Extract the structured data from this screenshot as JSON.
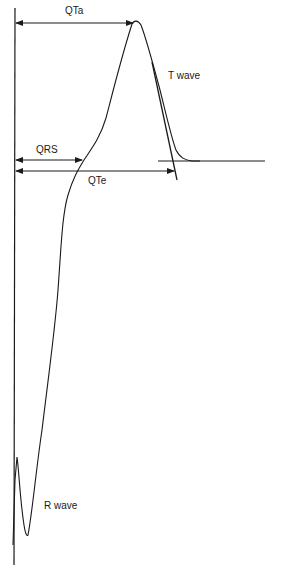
{
  "diagram": {
    "type": "ECG T-wave interval measurement diagram",
    "labels": {
      "qta": "QTa",
      "t_wave": "T wave",
      "qrs": "QRS",
      "qte": "QTe",
      "r_wave": "R wave"
    },
    "colors": {
      "stroke": "#1a1a1a",
      "background": "#ffffff"
    }
  }
}
